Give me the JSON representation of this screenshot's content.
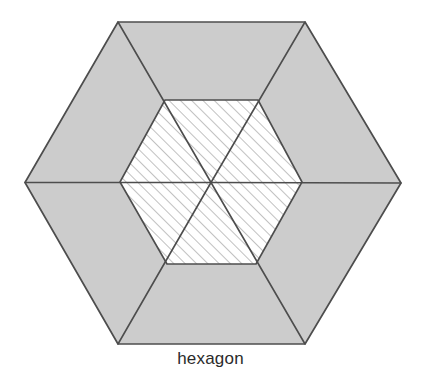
{
  "figure": {
    "caption": "hexagon",
    "colors": {
      "outer_fill": "#cccccc",
      "inner_fill": "#ffffff",
      "stroke": "#4d4d4d",
      "hatch_stroke": "#8c8c8c",
      "background": "#ffffff",
      "caption_color": "#2b2b2b"
    },
    "geometry": {
      "center": {
        "x": 211,
        "y": 182.5
      },
      "outer_hexagon": {
        "orientation": "flat-top",
        "width": 376,
        "height": 322,
        "vertices": [
          {
            "name": "left",
            "x": 25,
            "y": 182.5
          },
          {
            "name": "top-left",
            "x": 118,
            "y": 22
          },
          {
            "name": "top-right",
            "x": 305,
            "y": 22
          },
          {
            "name": "right",
            "x": 401,
            "y": 183
          },
          {
            "name": "bottom-right",
            "x": 305,
            "y": 344
          },
          {
            "name": "bottom-left",
            "x": 118,
            "y": 344
          }
        ]
      },
      "inner_hexagon": {
        "orientation": "flat-top",
        "width": 182,
        "height": 164,
        "vertices": [
          {
            "name": "left",
            "x": 120,
            "y": 182
          },
          {
            "name": "top-left",
            "x": 165,
            "y": 100
          },
          {
            "name": "top-right",
            "x": 258,
            "y": 100
          },
          {
            "name": "right",
            "x": 302,
            "y": 182
          },
          {
            "name": "bottom-right",
            "x": 256,
            "y": 264
          },
          {
            "name": "bottom-left",
            "x": 167,
            "y": 264
          }
        ]
      },
      "spoke_count": 6,
      "sector_count": 6,
      "hatched_sector_count": 6,
      "hatch_direction": "forward-slash",
      "hatch_spacing": 8,
      "stroke_width": 1.6
    }
  }
}
